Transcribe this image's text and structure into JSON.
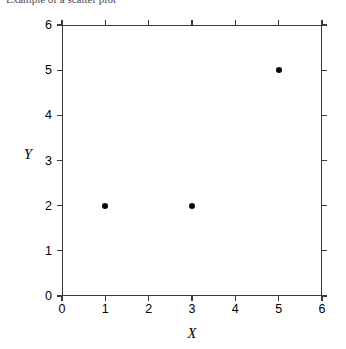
{
  "caption": {
    "clipped_top_text": "Example of a scatter plot"
  },
  "chart_data": {
    "type": "scatter",
    "title": "",
    "xlabel": "X",
    "ylabel": "Y",
    "xlim": [
      0,
      6
    ],
    "ylim": [
      0,
      6
    ],
    "xticks": [
      0,
      1,
      2,
      3,
      4,
      5,
      6
    ],
    "yticks": [
      0,
      1,
      2,
      3,
      4,
      5,
      6
    ],
    "xtick_labels": [
      "0",
      "1",
      "2",
      "3",
      "4",
      "5",
      "6"
    ],
    "ytick_labels": [
      "0",
      "1",
      "2",
      "3",
      "4",
      "5",
      "6"
    ],
    "grid": false,
    "legend": null,
    "marker": "filled-circle",
    "marker_color": "#000000",
    "frame_color": "#3a3a3a",
    "background": "#ffffff",
    "points": [
      {
        "x": 1,
        "y": 2
      },
      {
        "x": 3,
        "y": 2
      },
      {
        "x": 5,
        "y": 5
      }
    ],
    "x": [
      1,
      3,
      5
    ],
    "values": [
      2,
      2,
      5
    ]
  }
}
